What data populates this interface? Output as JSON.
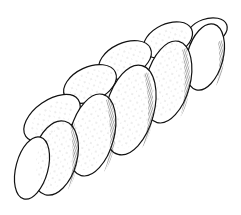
{
  "image": {
    "subject": "braided bread loaf (challah) line drawing",
    "background": "#ffffff",
    "ink": "#111111"
  }
}
